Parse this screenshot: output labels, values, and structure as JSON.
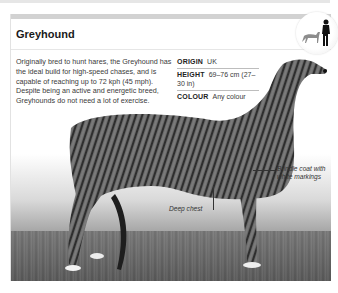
{
  "breed": {
    "title": "Greyhound",
    "description": "Originally bred to hunt hares, the Greyhound has the ideal build for high-speed chases, and is capable of reaching up to 72 kph (45 mph). Despite being an active and energetic breed, Greyhounds do not need a lot of exercise.",
    "facts": [
      {
        "key": "ORIGIN",
        "value": "UK"
      },
      {
        "key": "HEIGHT",
        "value": "69–76 cm (27–30 in)"
      },
      {
        "key": "COLOUR",
        "value": "Any colour"
      }
    ],
    "scale_icon": "dog-vs-human-size-icon"
  },
  "photo": {
    "subject": "brindle greyhound standing side view",
    "callouts": [
      {
        "label": "Brindle coat with white markings"
      },
      {
        "label": "Deep chest"
      }
    ]
  },
  "colors": {
    "header_bar": "#d2d2d2",
    "title_text": "#1a1a1a",
    "body_text": "#3a3a3a"
  }
}
